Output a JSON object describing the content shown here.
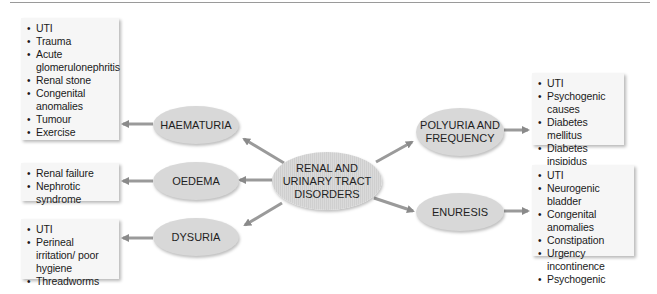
{
  "central_node": {
    "line1": "RENAL AND",
    "line2": "URINARY TRACT",
    "line3": "DISORDERS"
  },
  "nodes": [
    {
      "id": "haematuria",
      "label": "HAEMATURIA",
      "causes": [
        "UTI",
        "Trauma",
        "Acute glomerulonephritis",
        "Renal stone",
        "Congenital anomalies",
        "Tumour",
        "Exercise"
      ]
    },
    {
      "id": "oedema",
      "label": "OEDEMA",
      "causes": [
        "Renal failure",
        "Nephrotic syndrome"
      ]
    },
    {
      "id": "dysuria",
      "label": "DYSURIA",
      "causes": [
        "UTI",
        "Perineal irritation/ poor hygiene",
        "Threadworms"
      ]
    },
    {
      "id": "polyuria",
      "label_line1": "POLYURIA AND",
      "label_line2": "FREQUENCY",
      "causes": [
        "UTI",
        "Psychogenic causes",
        "Diabetes mellitus",
        "Diabetes insipidus",
        "Chronic renal failure"
      ]
    },
    {
      "id": "enuresis",
      "label": "ENURESIS",
      "causes": [
        "UTI",
        "Neurogenic bladder",
        "Congenital anomalies",
        "Constipation",
        "Urgency incontinence",
        "Psychogenic"
      ]
    }
  ],
  "colors": {
    "ellipse_fill": "#d8d8d8",
    "box_fill": "#f6f6f6",
    "arrow": "#8a8a8a"
  }
}
